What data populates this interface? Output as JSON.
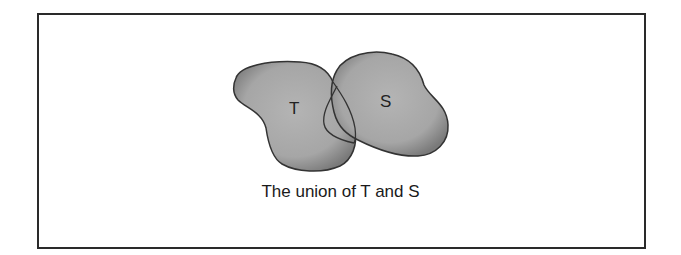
{
  "figure": {
    "shapes": [
      {
        "id": "T",
        "label": "T"
      },
      {
        "id": "S",
        "label": "S"
      }
    ],
    "caption": "The union of T and S",
    "fill_color": "#a8a8a8",
    "edge_color": "#333333"
  }
}
